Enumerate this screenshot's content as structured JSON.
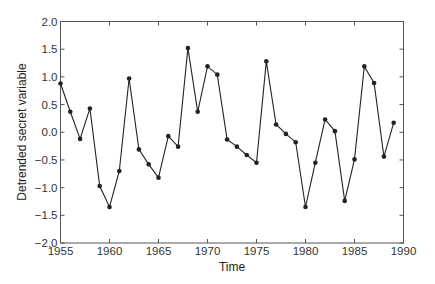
{
  "chart_data": {
    "type": "line",
    "title": "",
    "xlabel": "Time",
    "ylabel": "Detrended secret variable",
    "xlim": [
      1955,
      1990
    ],
    "ylim": [
      -2.0,
      2.0
    ],
    "grid": false,
    "legend": null,
    "x_ticks": [
      1955,
      1960,
      1965,
      1970,
      1975,
      1980,
      1985,
      1990
    ],
    "x_tick_labels": [
      "1955",
      "1960",
      "1965",
      "1970",
      "1975",
      "1980",
      "1985",
      "1990"
    ],
    "y_ticks": [
      2.0,
      1.5,
      1.0,
      0.5,
      0.0,
      -0.5,
      -1.0,
      -1.5,
      -2.0
    ],
    "y_tick_labels": [
      "2.0",
      "1.5",
      "1.0",
      "0.5",
      "0.0",
      "−0.5",
      "−1.0",
      "−1.5",
      "−2.0"
    ],
    "marker": "circle",
    "line_color": "#222222",
    "x": [
      1955,
      1956,
      1957,
      1958,
      1959,
      1960,
      1961,
      1962,
      1963,
      1964,
      1965,
      1966,
      1967,
      1968,
      1969,
      1970,
      1971,
      1972,
      1973,
      1974,
      1975,
      1976,
      1977,
      1978,
      1979,
      1980,
      1981,
      1982,
      1983,
      1984,
      1985,
      1986,
      1987,
      1988,
      1989
    ],
    "series": [
      {
        "name": "Detrended secret variable",
        "values": [
          0.88,
          0.37,
          -0.12,
          0.43,
          -0.97,
          -1.35,
          -0.7,
          0.97,
          -0.31,
          -0.58,
          -0.82,
          -0.07,
          -0.26,
          1.52,
          0.37,
          1.19,
          1.04,
          -0.13,
          -0.26,
          -0.41,
          -0.55,
          1.28,
          0.14,
          -0.03,
          -0.18,
          -1.35,
          -0.55,
          0.23,
          0.02,
          -1.24,
          -0.49,
          1.19,
          0.89,
          -0.44,
          0.17
        ]
      }
    ]
  }
}
